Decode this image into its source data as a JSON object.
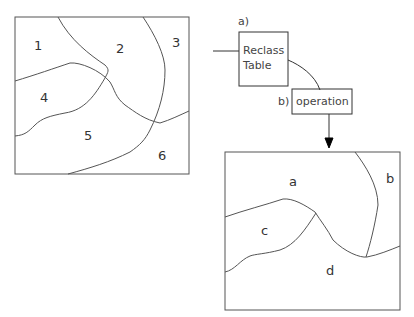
{
  "input_map": {
    "zones": [
      {
        "id": "1",
        "label": "1"
      },
      {
        "id": "2",
        "label": "2"
      },
      {
        "id": "3",
        "label": "3"
      },
      {
        "id": "4",
        "label": "4"
      },
      {
        "id": "5",
        "label": "5"
      },
      {
        "id": "6",
        "label": "6"
      }
    ]
  },
  "process": {
    "step_a": {
      "marker": "a)",
      "label_line1": "Reclass",
      "label_line2": "Table"
    },
    "step_b": {
      "marker": "b)",
      "label": "operation"
    }
  },
  "output_map": {
    "zones": [
      {
        "id": "a",
        "label": "a"
      },
      {
        "id": "b",
        "label": "b"
      },
      {
        "id": "c",
        "label": "c"
      },
      {
        "id": "d",
        "label": "d"
      }
    ]
  },
  "colors": {
    "stroke": "#444444",
    "background": "#ffffff"
  }
}
